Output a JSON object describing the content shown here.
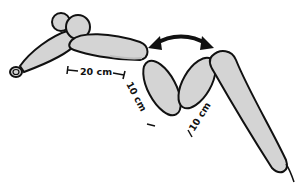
{
  "diagram": {
    "colors": {
      "balloon_fill": "#d4d4d4",
      "balloon_shade": "#bdbdbd",
      "outline": "#111111",
      "arrow": "#111111",
      "background": "#ffffff"
    },
    "measurements": [
      {
        "id": "segment-a",
        "label": "20 cm"
      },
      {
        "id": "segment-b",
        "label": "10 cm"
      },
      {
        "id": "segment-c",
        "label": "10 cm"
      }
    ],
    "arrow": {
      "type": "double-headed-curved",
      "meaning": "fold segments together"
    }
  }
}
